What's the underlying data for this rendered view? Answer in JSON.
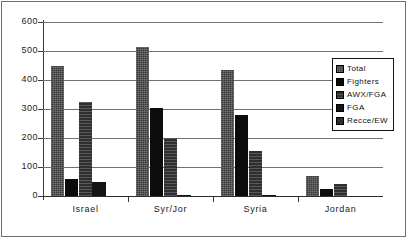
{
  "chart_data": {
    "type": "bar",
    "title": "",
    "xlabel": "",
    "ylabel": "",
    "ylim": [
      0,
      600
    ],
    "ytick_step": 100,
    "ytick_labels": [
      "0",
      "100",
      "200",
      "300",
      "400",
      "500",
      "600"
    ],
    "grid": true,
    "legend_position": "inside-right",
    "categories": [
      "Israel",
      "Syr/Jor",
      "Syria",
      "Jordan"
    ],
    "series": [
      {
        "name": "Total",
        "values": [
          450,
          515,
          435,
          70
        ]
      },
      {
        "name": "Fighters",
        "values": [
          60,
          305,
          280,
          25
        ]
      },
      {
        "name": "AWX/FGA",
        "values": [
          325,
          200,
          155,
          40
        ]
      },
      {
        "name": "FGA",
        "values": [
          50,
          5,
          5,
          0
        ]
      },
      {
        "name": "Recce/EW",
        "values": [
          0,
          0,
          0,
          0
        ]
      }
    ]
  },
  "legend": {
    "items": [
      {
        "label": "Total",
        "swatch": "legend-swatch-total"
      },
      {
        "label": "Fighters",
        "swatch": "legend-swatch-fighters"
      },
      {
        "label": "AWX/FGA",
        "swatch": "legend-swatch-awxfga"
      },
      {
        "label": "FGA",
        "swatch": "legend-swatch-fga"
      },
      {
        "label": "Recce/EW",
        "swatch": "legend-swatch-recce"
      }
    ]
  },
  "colors": {
    "axis": "#3a3a3a",
    "grid": "#727272",
    "frame": "#6f6f6f",
    "bar_total": "#3a3a3a",
    "bar_fighters": "#0c0c0c",
    "bar_awxfga": "#2f2f2f",
    "bar_fga": "#151515",
    "bar_recce": "#262626",
    "text": "#1a1a1a",
    "background": "#ffffff"
  }
}
